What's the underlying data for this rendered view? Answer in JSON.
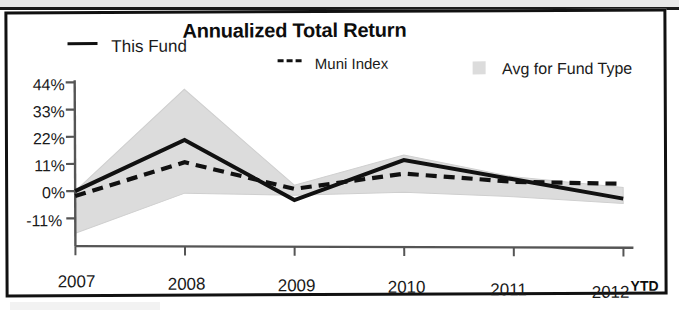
{
  "chart_data": {
    "type": "line",
    "title": "Annualized Total Return",
    "xlabel": "",
    "ylabel": "",
    "x": [
      "2007",
      "2008",
      "2009",
      "2010",
      "2011",
      "2012"
    ],
    "categories": [
      "2007",
      "2008",
      "2009",
      "2010",
      "2011",
      "2012"
    ],
    "x_axis_suffix": "YTD",
    "ytick_labels": [
      "44%",
      "33%",
      "22%",
      "11%",
      "0%",
      "-11%"
    ],
    "ytick_values": [
      44,
      33,
      22,
      11,
      0,
      -11
    ],
    "ylim": [
      -18,
      48
    ],
    "grid": false,
    "legend_position": "top",
    "series": [
      {
        "name": "This Fund",
        "style": "solid",
        "color": "#111111",
        "values": [
          0,
          20.5,
          -4,
          12,
          4,
          -4
        ]
      },
      {
        "name": "Muni Index",
        "style": "dashed",
        "color": "#111111",
        "values": [
          -2,
          11.5,
          0.5,
          6.5,
          3,
          2
        ]
      },
      {
        "name": "Avg for Fund Type",
        "style": "band",
        "color": "#dcdcdc",
        "upper": [
          0,
          41,
          2,
          14,
          5,
          0.5
        ],
        "lower": [
          -17,
          -1,
          -2,
          -1,
          -3,
          -6
        ]
      }
    ]
  },
  "legend": {
    "this_fund": "This Fund",
    "muni_index": "Muni Index",
    "avg_fund_type": "Avg for Fund Type"
  },
  "axis": {
    "y": {
      "t0": "44%",
      "t1": "33%",
      "t2": "22%",
      "t3": "11%",
      "t4": "0%",
      "t5": "-11%"
    },
    "x": {
      "t0": "2007",
      "t1": "2008",
      "t2": "2009",
      "t3": "2010",
      "t4": "2011",
      "t5": "2012",
      "suffix": "YTD"
    }
  },
  "colors": {
    "line": "#111111",
    "band": "#dcdcdc",
    "axis": "#555555",
    "frame": "#111111"
  }
}
